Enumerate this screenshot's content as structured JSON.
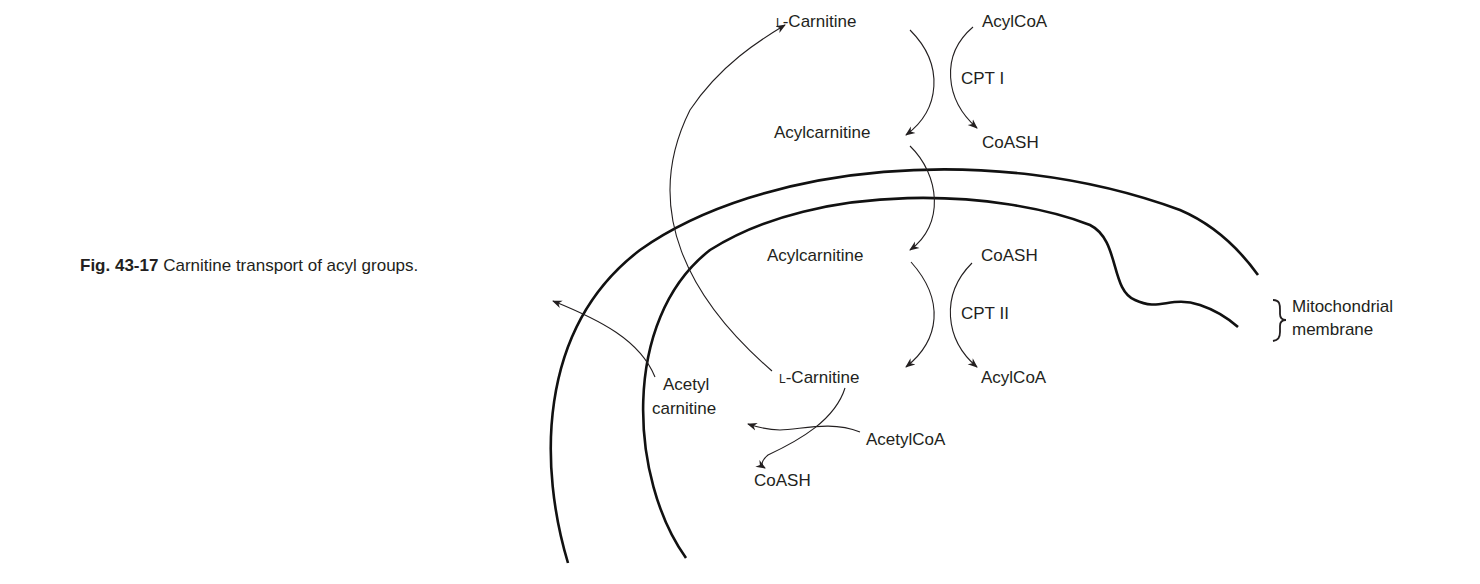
{
  "caption": {
    "figure_number": "Fig. 43-17",
    "text": " Carnitine transport of acyl groups."
  },
  "diagram": {
    "title": "Carnitine transport of acyl groups",
    "outer_side": {
      "carnitine": {
        "prefix": "L",
        "name": "-Carnitine"
      },
      "acylcarnitine": "Acylcarnitine",
      "enzyme": "CPT I",
      "substrate": "AcylCoA",
      "product": "CoASH"
    },
    "inner_side": {
      "acylcarnitine": "Acylcarnitine",
      "carnitine": {
        "prefix": "L",
        "name": "-Carnitine"
      },
      "enzyme": "CPT II",
      "substrate": "CoASH",
      "product": "AcylCoA"
    },
    "acetyl_branch": {
      "acetyl_carnitine_line1": "Acetyl",
      "acetyl_carnitine_line2": "carnitine",
      "substrate": "AcetylCoA",
      "product": "CoASH"
    },
    "membrane_label": {
      "line1": "Mitochondrial",
      "line2": "membrane"
    }
  }
}
